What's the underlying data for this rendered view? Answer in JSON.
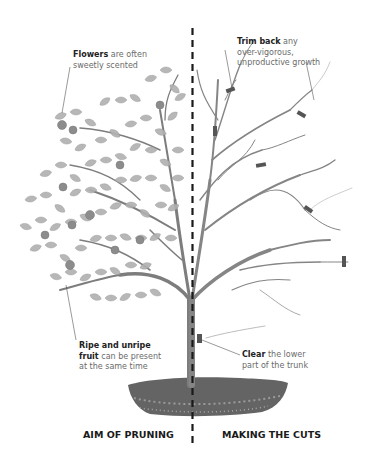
{
  "diagram": {
    "title_left": "AIM OF PRUNING",
    "title_right": "MAKING THE CUTS",
    "annotations": {
      "flowers": {
        "bold": "Flowers",
        "rest_line1": " are often",
        "line2": "sweetly scented"
      },
      "trim_back": {
        "bold": "Trim back",
        "rest_line1": " any",
        "line2": "over-vigorous,",
        "line3": "unproductive growth"
      },
      "fruit": {
        "bold_line1": "Ripe and unripe",
        "bold_line2": "fruit",
        "rest_line2": " can be present",
        "line3": "at the same time"
      },
      "clear": {
        "bold": "Clear",
        "rest_line1": " the lower",
        "line2": "part of the trunk"
      }
    },
    "colors": {
      "foliage": "#a8a8a8",
      "branch": "#7a7a7a",
      "trunk": "#6b6b6b",
      "soil": "#5e5e5e",
      "cut_marker": "#555555",
      "divider": "#1a1a1a"
    }
  }
}
